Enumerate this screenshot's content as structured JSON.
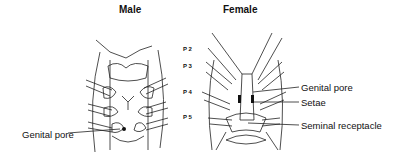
{
  "titles": {
    "male": "Male",
    "female": "Female"
  },
  "legs": [
    "P 2",
    "P 3",
    "P 4",
    "P 5"
  ],
  "male_labels": {
    "genital_pore": "Genital pore"
  },
  "female_labels": {
    "genital_pore": "Genital pore",
    "setae": "Setae",
    "seminal_receptacle": "Seminal receptacle"
  }
}
